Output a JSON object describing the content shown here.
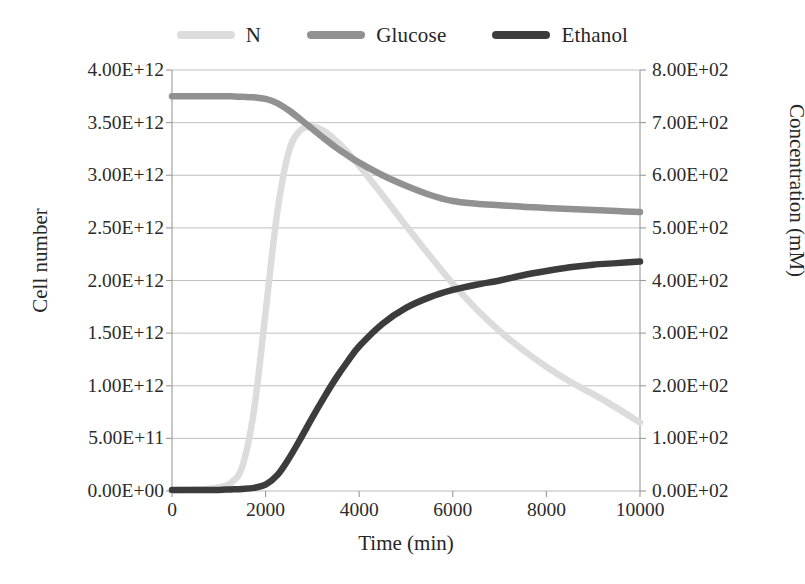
{
  "chart_data": {
    "type": "line",
    "title": "",
    "xlabel": "Time (min)",
    "ylabel": "Cell number",
    "y2label": "Concentration (mM)",
    "xlim": [
      0,
      10000
    ],
    "ylim": [
      0,
      4000000000000
    ],
    "y2lim": [
      0,
      800
    ],
    "grid": true,
    "legend_position": "top-center",
    "xticks": [
      "0",
      "2000",
      "4000",
      "6000",
      "8000",
      "10000"
    ],
    "xtick_values": [
      0,
      2000,
      4000,
      6000,
      8000,
      10000
    ],
    "yticks_left": [
      "0.00E+00",
      "5.00E+11",
      "1.00E+12",
      "1.50E+12",
      "2.00E+12",
      "2.50E+12",
      "3.00E+12",
      "3.50E+12",
      "4.00E+12"
    ],
    "ytick_left_values": [
      0,
      500000000000,
      1000000000000,
      1500000000000,
      2000000000000,
      2500000000000,
      3000000000000,
      3500000000000,
      4000000000000
    ],
    "yticks_right": [
      "0.00E+02",
      "1.00E+02",
      "2.00E+02",
      "3.00E+02",
      "4.00E+02",
      "5.00E+02",
      "6.00E+02",
      "7.00E+02",
      "8.00E+02"
    ],
    "ytick_right_values": [
      0,
      100,
      200,
      300,
      400,
      500,
      600,
      700,
      800
    ],
    "x": [
      0,
      250,
      500,
      750,
      1000,
      1250,
      1500,
      1750,
      2000,
      2250,
      2500,
      2750,
      3000,
      3250,
      3500,
      3750,
      4000,
      4500,
      5000,
      5500,
      6000,
      6500,
      7000,
      7500,
      8000,
      8500,
      9000,
      9500,
      10000
    ],
    "series": [
      {
        "name": "N",
        "axis": "left",
        "color": "#dcdcdc",
        "unit": "cells",
        "values": [
          8000000000,
          10000000000,
          14000000000,
          20000000000,
          34000000000,
          75000000000,
          230000000000,
          760000000000,
          1700000000000,
          2650000000000,
          3230000000000,
          3430000000000,
          3460000000000,
          3420000000000,
          3330000000000,
          3220000000000,
          3090000000000,
          2810000000000,
          2520000000000,
          2240000000000,
          1970000000000,
          1730000000000,
          1520000000000,
          1340000000000,
          1180000000000,
          1040000000000,
          920000000000,
          790000000000,
          650000000000
        ]
      },
      {
        "name": "Glucose",
        "axis": "right",
        "color": "#919191",
        "unit": "mM",
        "values": [
          750,
          750,
          750,
          750,
          750,
          750,
          749,
          748,
          745,
          737,
          723,
          706,
          688,
          670,
          653,
          638,
          624,
          600,
          580,
          563,
          551,
          546,
          543,
          540,
          538,
          536,
          534,
          532,
          530
        ]
      },
      {
        "name": "Ethanol",
        "axis": "right",
        "color": "#3c3c3c",
        "unit": "mM",
        "values": [
          2,
          2,
          2,
          2,
          2,
          3,
          4,
          6,
          12,
          30,
          62,
          100,
          140,
          178,
          214,
          246,
          275,
          318,
          348,
          368,
          382,
          392,
          400,
          410,
          418,
          425,
          430,
          433,
          436
        ]
      }
    ]
  },
  "legend": {
    "entries": [
      {
        "label": "N",
        "color": "#dcdcdc"
      },
      {
        "label": "Glucose",
        "color": "#919191"
      },
      {
        "label": "Ethanol",
        "color": "#3c3c3c"
      }
    ]
  },
  "axes": {
    "x_title": "Time (min)",
    "y_left_title": "Cell number",
    "y_right_title": "Concentration (mM)"
  },
  "style": {
    "grid_color": "#b9b9b9",
    "axis_color": "#9a9a9a",
    "background": "#ffffff"
  }
}
